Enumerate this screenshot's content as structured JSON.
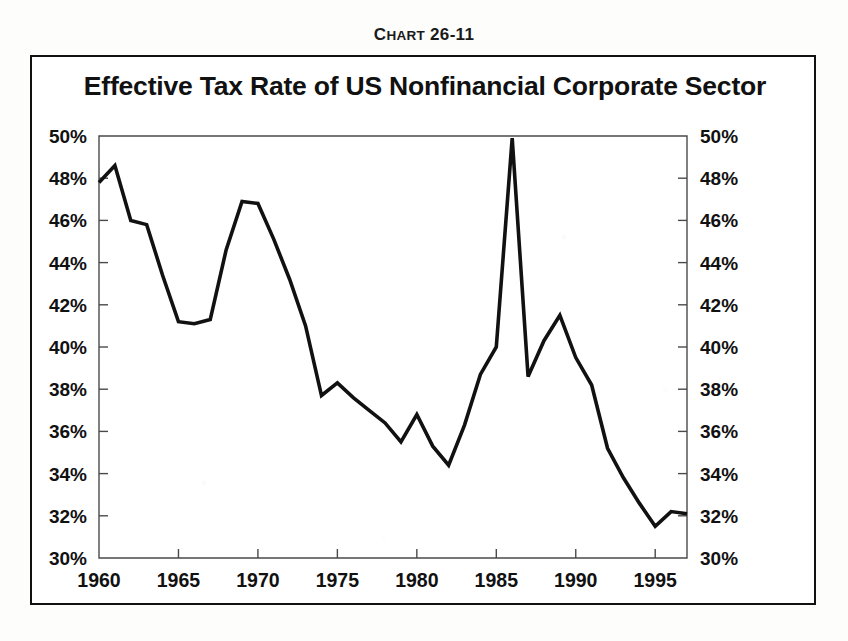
{
  "figure": {
    "caption_lead": "C",
    "caption_rest": "HART",
    "caption_number": " 26-11",
    "caption_full": "CHART 26-11"
  },
  "chart_data": {
    "type": "line",
    "title": "Effective Tax Rate of US Nonfinancial Corporate Sector",
    "xlabel": "",
    "ylabel": "",
    "xlim": [
      1960,
      1997
    ],
    "ylim": [
      30,
      50
    ],
    "ytick_step": 2,
    "grid": false,
    "legend": null,
    "legend_position": "none",
    "line_color": "#111111",
    "background_color": "#ffffff",
    "dual_y_axis": true,
    "x_ticks": [
      1960,
      1965,
      1970,
      1975,
      1980,
      1985,
      1990,
      1995
    ],
    "x_tick_labels": [
      "1960",
      "1965",
      "1970",
      "1975",
      "1980",
      "1985",
      "1990",
      "1995"
    ],
    "y_ticks": [
      30,
      32,
      34,
      36,
      38,
      40,
      42,
      44,
      46,
      48,
      50
    ],
    "y_tick_labels_left": [
      "30%",
      "32%",
      "34%",
      "36%",
      "38%",
      "40%",
      "42%",
      "44%",
      "46%",
      "48%",
      "50%"
    ],
    "y_tick_labels_right": [
      "30%",
      "32%",
      "34%",
      "36%",
      "38%",
      "40%",
      "42%",
      "44%",
      "46%",
      "48%",
      "50%"
    ],
    "x": [
      1960,
      1961,
      1962,
      1963,
      1964,
      1965,
      1966,
      1967,
      1968,
      1969,
      1970,
      1971,
      1972,
      1973,
      1974,
      1975,
      1976,
      1977,
      1978,
      1979,
      1980,
      1981,
      1982,
      1983,
      1984,
      1985,
      1986,
      1987,
      1988,
      1989,
      1990,
      1991,
      1992,
      1993,
      1994,
      1995,
      1996,
      1997
    ],
    "values": [
      47.8,
      48.6,
      46.0,
      45.8,
      43.4,
      41.2,
      41.1,
      41.3,
      44.6,
      46.9,
      46.8,
      45.1,
      43.2,
      41.0,
      37.7,
      38.3,
      37.6,
      37.0,
      36.4,
      35.5,
      36.8,
      35.3,
      34.4,
      36.3,
      38.7,
      40.0,
      49.9,
      38.6,
      40.3,
      41.5,
      39.5,
      38.2,
      35.2,
      33.8,
      32.6,
      31.5,
      32.2,
      32.1
    ],
    "series_name": "Effective Tax Rate",
    "units": "percent"
  }
}
